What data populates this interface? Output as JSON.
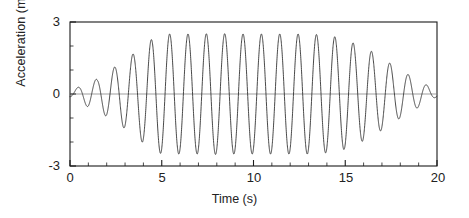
{
  "chart_data": {
    "type": "line",
    "title": "",
    "xlabel": "Time (s)",
    "ylabel": "Acceleration (m/s²)",
    "xlim": [
      0,
      20
    ],
    "ylim": [
      -3,
      3
    ],
    "xticks": [
      0,
      5,
      10,
      15,
      20
    ],
    "yticks": [
      3,
      0,
      -3
    ],
    "xtick_labels": [
      "0",
      "5",
      "10",
      "15",
      "20"
    ],
    "ytick_labels": [
      "3",
      "0",
      "-3"
    ],
    "x_minor_tick_interval": 1,
    "y_minor_tick_interval": 1,
    "grid": false,
    "legend": null,
    "series": [
      {
        "name": "acceleration",
        "color": "#333333",
        "description": "Amplitude-modulated ~1 Hz sinusoid: envelope ramps up from 0 to about 2.5 m/s^2 between t=0 and t=5 s, holds a plateau near 2.5 m/s^2 from t=5 s to t=15 s, then decays back toward 0 by t=20 s",
        "frequency_hz": 1.0,
        "peak_amplitude": 2.5,
        "envelope_x": [
          0,
          0.5,
          1.0,
          1.5,
          2.0,
          2.5,
          3.0,
          3.5,
          4.0,
          4.5,
          5.0,
          6.0,
          7.0,
          8.0,
          9.0,
          10.0,
          11.0,
          12.0,
          13.0,
          14.0,
          15.0,
          15.5,
          16.0,
          16.5,
          17.0,
          17.5,
          18.0,
          18.5,
          19.0,
          19.5,
          20.0
        ],
        "envelope_y": [
          0.12,
          0.3,
          0.55,
          0.62,
          0.95,
          1.15,
          1.45,
          1.7,
          2.05,
          2.3,
          2.5,
          2.5,
          2.5,
          2.52,
          2.5,
          2.5,
          2.5,
          2.5,
          2.5,
          2.45,
          2.3,
          2.1,
          1.95,
          1.75,
          1.5,
          1.25,
          1.0,
          0.78,
          0.55,
          0.35,
          0.1
        ]
      }
    ]
  },
  "axis": {
    "ylabel": "Acceleration (m/s",
    "ylabel_sup": "2",
    "ylabel_close": ")",
    "xlabel": "Time (s)",
    "y_top": "3",
    "y_mid": "0",
    "y_bot": "-3",
    "x0": "0",
    "x5": "5",
    "x10": "10",
    "x15": "15",
    "x20": "20"
  },
  "colors": {
    "line": "#333333",
    "axis": "#1a1a1a",
    "zero_line": "#777777",
    "background": "#ffffff"
  }
}
